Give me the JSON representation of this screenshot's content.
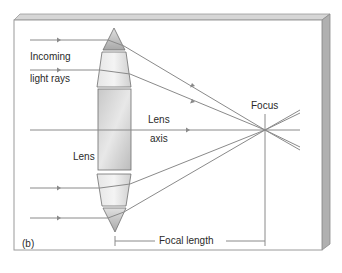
{
  "figure": {
    "panel_label": "(b)",
    "labels": {
      "incoming_line1": "Incoming",
      "incoming_line2": "light rays",
      "lens_axis_line1": "Lens",
      "lens_axis_line2": "axis",
      "lens": "Lens",
      "focus": "Focus",
      "focal_length": "Focal length"
    },
    "colors": {
      "ray": "#8a8a8a",
      "lens_fill": "#d8d8d8",
      "prism_fill": "#bdbdbd",
      "frame": "#9a9a9a"
    }
  }
}
